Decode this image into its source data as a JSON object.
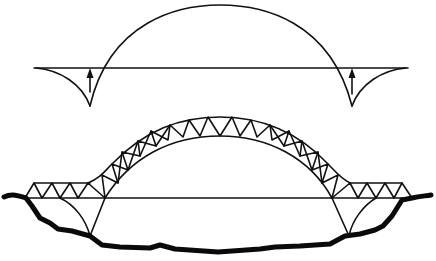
{
  "diagram": {
    "colors": {
      "line": "#111111",
      "ground": "#0a0a0a",
      "background": "#ffffff"
    },
    "panels": [
      {
        "id": "thrust-line-schematic",
        "elements": [
          "deck-line",
          "arch-curve",
          "left-cusp",
          "right-cusp",
          "left-up-arrow",
          "right-up-arrow"
        ]
      },
      {
        "id": "truss-arch-bridge",
        "elements": [
          "arched-truss",
          "left-approach-truss",
          "right-approach-truss",
          "deck-line",
          "support-arcs",
          "ground-profile"
        ]
      }
    ]
  }
}
